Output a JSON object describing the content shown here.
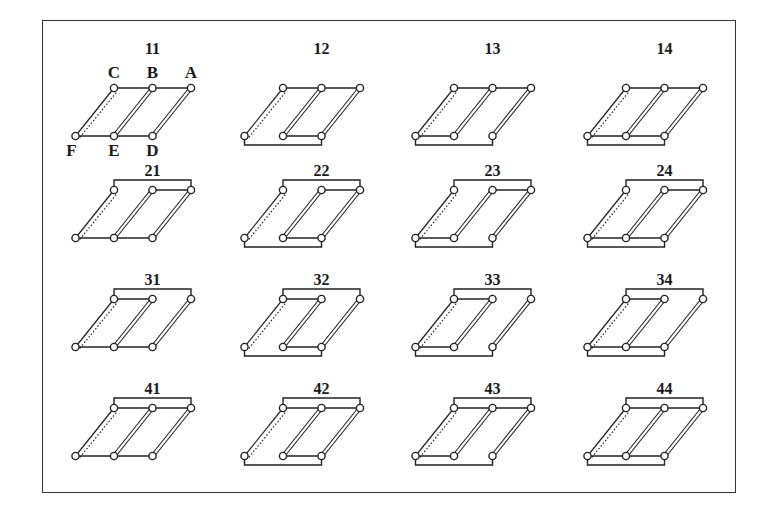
{
  "figure": {
    "title": "",
    "node_labels": {
      "A": "A",
      "B": "B",
      "C": "C",
      "D": "D",
      "E": "E",
      "F": "F"
    },
    "colors": {
      "line": "#222222",
      "node_fill": "#ffffff",
      "frame": "#333333"
    },
    "legend_rows": {
      "1": {
        "top_bracket": false,
        "top_CB": true,
        "top_BA": true
      },
      "2": {
        "top_bracket": true,
        "top_CB": false,
        "top_BA": true
      },
      "3": {
        "top_bracket": true,
        "top_CB": true,
        "top_BA": false
      },
      "4": {
        "top_bracket": true,
        "top_CB": true,
        "top_BA": true
      }
    },
    "legend_cols": {
      "1": {
        "bottom_bracket": false,
        "bottom_FE": true,
        "bottom_ED": true
      },
      "2": {
        "bottom_bracket": true,
        "bottom_FE": false,
        "bottom_ED": true
      },
      "3": {
        "bottom_bracket": true,
        "bottom_FE": true,
        "bottom_ED": false
      },
      "4": {
        "bottom_bracket": true,
        "bottom_FE": true,
        "bottom_ED": true
      }
    },
    "panels": [
      {
        "label": "11",
        "row": 1,
        "col": 1,
        "show_node_labels": true
      },
      {
        "label": "12",
        "row": 1,
        "col": 2
      },
      {
        "label": "13",
        "row": 1,
        "col": 3
      },
      {
        "label": "14",
        "row": 1,
        "col": 4
      },
      {
        "label": "21",
        "row": 2,
        "col": 1
      },
      {
        "label": "22",
        "row": 2,
        "col": 2
      },
      {
        "label": "23",
        "row": 2,
        "col": 3
      },
      {
        "label": "24",
        "row": 2,
        "col": 4
      },
      {
        "label": "31",
        "row": 3,
        "col": 1
      },
      {
        "label": "32",
        "row": 3,
        "col": 2
      },
      {
        "label": "33",
        "row": 3,
        "col": 3
      },
      {
        "label": "34",
        "row": 3,
        "col": 4
      },
      {
        "label": "41",
        "row": 4,
        "col": 1
      },
      {
        "label": "42",
        "row": 4,
        "col": 2
      },
      {
        "label": "43",
        "row": 4,
        "col": 3
      },
      {
        "label": "44",
        "row": 4,
        "col": 4
      }
    ]
  }
}
